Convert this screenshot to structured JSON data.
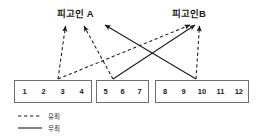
{
  "diagram": {
    "title_left": "피고인 A",
    "title_right": "피고인B",
    "groups": [
      {
        "name": "group-1",
        "items": [
          "1",
          "2",
          "3",
          "4"
        ]
      },
      {
        "name": "group-2",
        "items": [
          "5",
          "6",
          "7"
        ]
      },
      {
        "name": "group-3",
        "items": [
          "8",
          "9",
          "10",
          "11",
          "12"
        ]
      }
    ],
    "legend": [
      {
        "style": "dashed",
        "label": "유죄"
      },
      {
        "style": "solid",
        "label": "무죄"
      }
    ],
    "edges": [
      {
        "from": "3",
        "to": "피고인 A",
        "style": "dashed"
      },
      {
        "from": "6",
        "to": "피고인 A",
        "style": "dashed"
      },
      {
        "from": "3",
        "to": "피고인B",
        "style": "dashed"
      },
      {
        "from": "10",
        "to": "피고인B",
        "style": "dashed"
      },
      {
        "from": "6",
        "to": "피고인B",
        "style": "solid"
      },
      {
        "from": "10",
        "to": "피고인 A",
        "style": "solid"
      }
    ],
    "colors": {
      "line": "#1a1a1a",
      "box_border": "#6e6e6e",
      "text": "#1a1a1a",
      "background": "#ffffff"
    }
  }
}
